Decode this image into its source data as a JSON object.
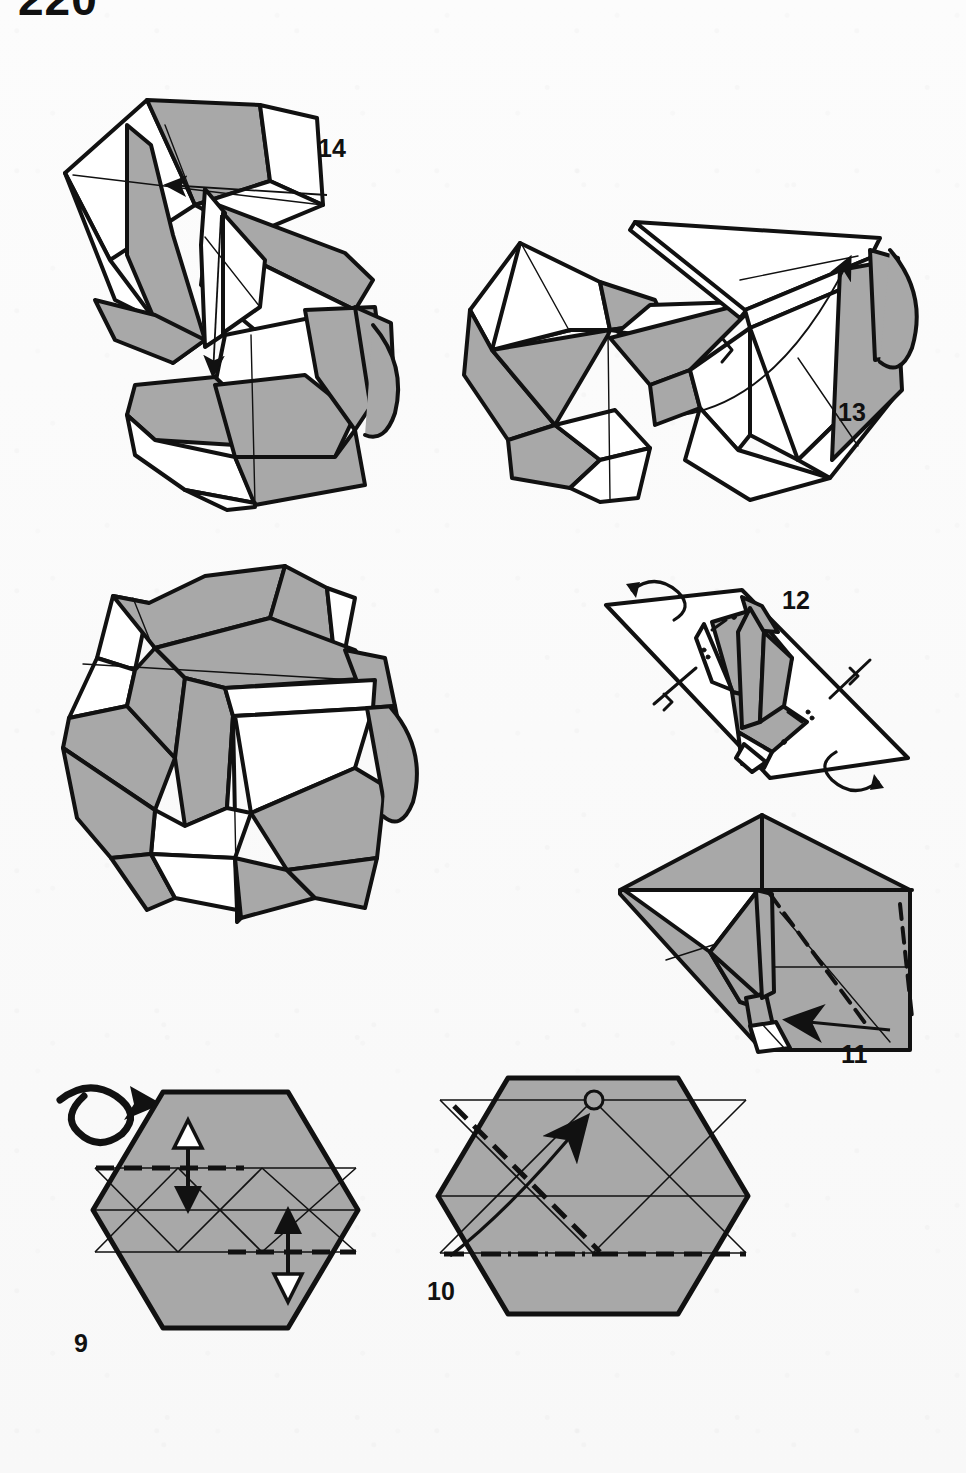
{
  "page": {
    "number": "220",
    "type": "origami-instruction-diagram",
    "background_color": "#fbfbfb",
    "paper_front_color": "#a8a8a8",
    "paper_back_color": "#ffffff",
    "ink_color": "#111111"
  },
  "symbols": {
    "turn_over": "turn-over-arrow",
    "valley_fold": "dashed-line",
    "mountain_fold": "dash-dot-line",
    "crease_line": "thin-solid-line",
    "fold_arrow": "solid-arrowhead",
    "push_pull_arrow": "double-headed-arrow",
    "reference_point": "small-circle",
    "rotate": "rotation-arrow",
    "right_angle": "right-angle-mark"
  },
  "figures": [
    {
      "id": "step-14",
      "label": "14",
      "label_x": 318,
      "label_y": 136,
      "description": "Three-dimensional twisted spiral form with two fold arrows",
      "arrows": 2,
      "shading": "gray-and-white"
    },
    {
      "id": "step-13",
      "label": "13",
      "label_x": 838,
      "label_y": 400,
      "description": "Three-dimensional box form opening with curved arrow to the upper right",
      "arrows": 1,
      "shading": "gray-and-white"
    },
    {
      "id": "final-model",
      "label": "",
      "label_x": 0,
      "label_y": 0,
      "description": "Completed twisted rose-box model, no step number",
      "arrows": 0,
      "shading": "gray-and-white"
    },
    {
      "id": "step-12",
      "label": "12",
      "label_x": 782,
      "label_y": 588,
      "description": "Flattened diamond form seen edge on, with two rotation arrows and two right-angle marks",
      "arrows": 2,
      "shading": "gray-and-white"
    },
    {
      "id": "step-11",
      "label": "11",
      "label_x": 841,
      "label_y": 1042,
      "description": "Partly collapsed kite form with valley fold, mountain fold and a fold arrow pointing down-left",
      "arrows": 1,
      "shading": "gray"
    },
    {
      "id": "step-10",
      "label": "10",
      "label_x": 427,
      "label_y": 1279,
      "description": "Gray hexagon with diagonal valley fold, lower mountain fold, curved arrow to a reference circle",
      "arrows": 1,
      "shading": "gray"
    },
    {
      "id": "step-9",
      "label": "9",
      "label_x": 74,
      "label_y": 1331,
      "description": "Gray hexagon with precrease grid, two valley folds and two double-headed fold arrows; turn-over symbol at upper left",
      "arrows": 2,
      "shading": "gray"
    }
  ]
}
